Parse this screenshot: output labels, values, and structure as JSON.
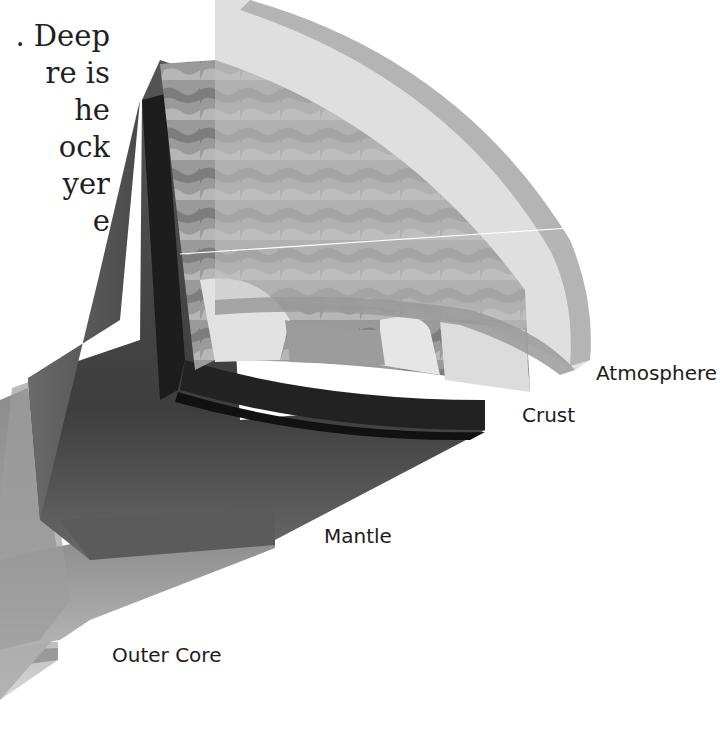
{
  "caption": {
    "fragment_lines": [
      ". Deep",
      "re is",
      "he",
      "ock",
      "yer",
      "e"
    ]
  },
  "diagram": {
    "labels": {
      "atmosphere": "Atmosphere",
      "crust": "Crust",
      "mantle": "Mantle",
      "outer_core": "Outer Core"
    },
    "colors": {
      "background": "#ffffff",
      "atmosphere_shell": "#b9b9b9",
      "surface_land": "#8a8a8a",
      "surface_light": "#d9d9d9",
      "crust_edge": "#1e1e1e",
      "mantle": "#4b4b4b",
      "outer_core": "#a9a9a9",
      "inner_core": "#c9c9c9",
      "text": "#1c1c1c"
    }
  }
}
